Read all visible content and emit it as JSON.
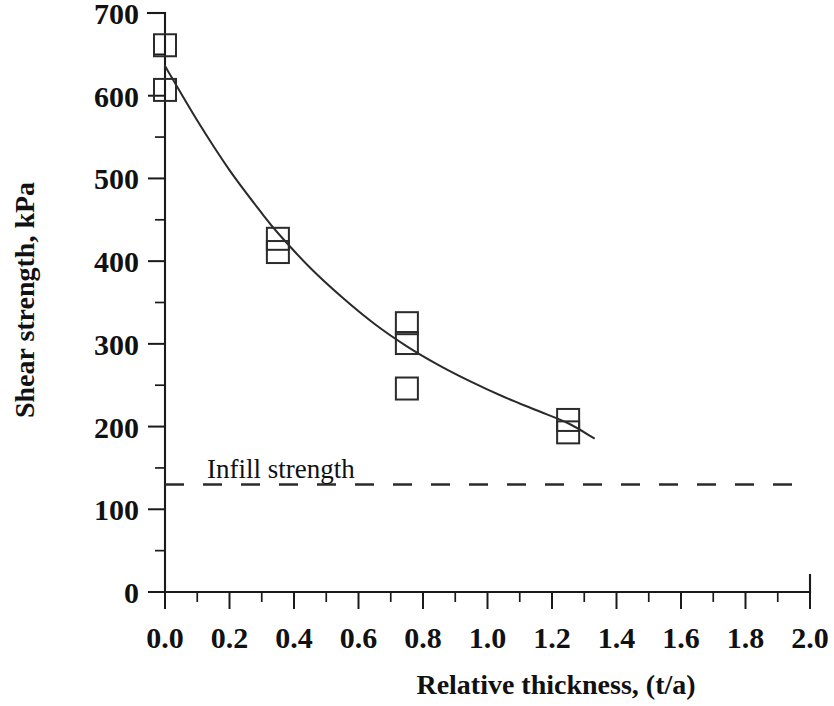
{
  "chart_data": {
    "type": "scatter",
    "title": "",
    "xlabel": "Relative thickness, (t/a)",
    "ylabel": "Shear strength, kPa",
    "xlim": [
      0.0,
      2.0
    ],
    "ylim": [
      0,
      700
    ],
    "x_major_step": 0.2,
    "x_minor_step": 0.1,
    "y_major_step": 100,
    "y_minor_step": 50,
    "grid": false,
    "legend": false,
    "x_tick_labels": [
      "0.0",
      "0.2",
      "0.4",
      "0.6",
      "0.8",
      "1.0",
      "1.2",
      "1.4",
      "1.6",
      "1.8",
      "2.0"
    ],
    "y_tick_labels": [
      "0",
      "100",
      "200",
      "300",
      "400",
      "500",
      "600",
      "700"
    ],
    "series": [
      {
        "name": "Measured shear strength",
        "marker": "open-square",
        "x": [
          0.0,
          0.0,
          0.35,
          0.35,
          0.75,
          0.75,
          0.75,
          1.25,
          1.25
        ],
        "y": [
          661,
          607,
          427,
          411,
          325,
          301,
          246,
          208,
          193
        ]
      },
      {
        "name": "Fitted curve",
        "marker": "none",
        "type": "line",
        "x": [
          0.0,
          0.1,
          0.2,
          0.3,
          0.35,
          0.45,
          0.55,
          0.65,
          0.75,
          0.85,
          0.95,
          1.05,
          1.15,
          1.25,
          1.33
        ],
        "y": [
          636,
          570,
          510,
          458,
          434,
          392,
          356,
          324,
          297,
          274,
          254,
          236,
          220,
          204,
          186
        ]
      }
    ],
    "annotations": [
      {
        "name": "infill-strength",
        "label": "Infill strength",
        "type": "hline",
        "value": 130,
        "style": "dashed",
        "x_start": 0.0,
        "x_end": 2.0,
        "label_x": 0.13,
        "label_y": 150
      }
    ],
    "colors": {
      "ink": "#1a1a1a",
      "curve": "#2a2a2a",
      "marker": "#2b2b2b",
      "background": "#ffffff"
    }
  }
}
